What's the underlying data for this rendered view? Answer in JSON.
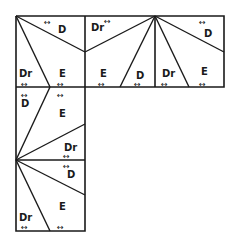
{
  "diagram": {
    "arrow_glyph": "↔",
    "line_color": "#1a1a1a",
    "tiles": [
      {
        "id": "top-left",
        "labels": [
          "D",
          "Dr",
          "E"
        ]
      },
      {
        "id": "top-middle",
        "labels": [
          "Dr",
          "E",
          "D"
        ]
      },
      {
        "id": "top-right",
        "labels": [
          "Dr",
          "D",
          "E"
        ]
      },
      {
        "id": "middle-left",
        "labels": [
          "D",
          "E",
          "Dr"
        ]
      },
      {
        "id": "bottom-left",
        "labels": [
          "D",
          "E",
          "Dr"
        ]
      }
    ],
    "labels": {
      "tl_d": "D",
      "tl_dr": "Dr",
      "tl_e": "E",
      "tm_dr": "Dr",
      "tm_e": "E",
      "tm_d": "D",
      "tr_dr": "Dr",
      "tr_d": "D",
      "tr_e": "E",
      "ml_d": "D",
      "ml_e": "E",
      "ml_dr": "Dr",
      "bl_d": "D",
      "bl_e": "E",
      "bl_dr": "Dr"
    }
  }
}
